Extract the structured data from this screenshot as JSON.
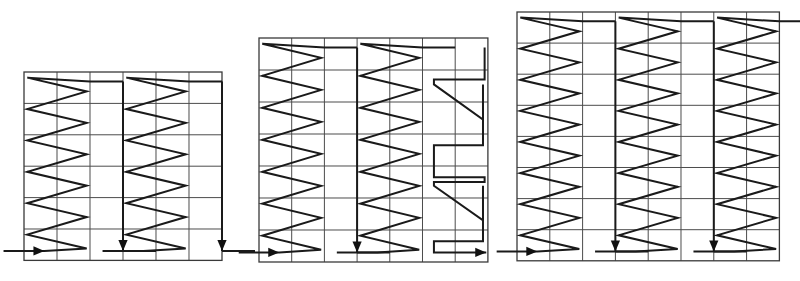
{
  "figure": {
    "title": "",
    "background_color": "#ffffff",
    "grid_line_color": "#4a4a4a",
    "path_color": "#1a1a1a",
    "panel_count": 3
  },
  "panels": [
    {
      "name": "panel-left",
      "label": "",
      "grid": {
        "cols": 6,
        "rows": 6
      },
      "origin": {
        "x": 24,
        "y": 72
      },
      "cell": {
        "w": 33.0,
        "h": 31.4
      },
      "bands": [
        {
          "name": "band-1",
          "type": "zigzag-up",
          "start_col": 0,
          "width_cols": 2,
          "teeth": 6,
          "entry": {
            "col": 0,
            "row": 6,
            "dir": "right"
          },
          "entry_arrow": true,
          "exit": {
            "col": 2,
            "row": 0,
            "dir": "right"
          }
        },
        {
          "name": "return-1",
          "type": "vertical-down",
          "col": 3,
          "from_row": 0,
          "to_row": 6,
          "arrow": true
        },
        {
          "name": "band-2",
          "type": "zigzag-up",
          "start_col": 3,
          "width_cols": 2,
          "teeth": 6,
          "entry": {
            "col": 3,
            "row": 6,
            "dir": "right"
          },
          "entry_arrow": false,
          "exit": {
            "col": 5,
            "row": 0,
            "dir": "right"
          }
        },
        {
          "name": "return-2",
          "type": "vertical-down",
          "col": 6,
          "from_row": 0,
          "to_row": 6,
          "arrow": true
        }
      ]
    },
    {
      "name": "panel-middle",
      "label": "",
      "grid": {
        "cols": 7,
        "rows": 7
      },
      "origin": {
        "x": 259,
        "y": 38
      },
      "cell": {
        "w": 32.7,
        "h": 32.0
      },
      "bands": [
        {
          "name": "band-1",
          "type": "zigzag-up",
          "start_col": 0,
          "width_cols": 2,
          "teeth": 7,
          "entry": {
            "col": 0,
            "row": 7,
            "dir": "right"
          },
          "entry_arrow": true,
          "exit": {
            "col": 2,
            "row": 0,
            "dir": "right"
          }
        },
        {
          "name": "return-1",
          "type": "vertical-down",
          "col": 3,
          "from_row": 0,
          "to_row": 7,
          "arrow": true
        },
        {
          "name": "band-2",
          "type": "zigzag-up",
          "start_col": 3,
          "width_cols": 2,
          "teeth": 7,
          "entry": {
            "col": 3,
            "row": 7,
            "dir": "right"
          },
          "entry_arrow": false,
          "exit": {
            "col": 5,
            "row": 0,
            "dir": "right"
          }
        },
        {
          "name": "band-3",
          "type": "z-step-down",
          "start_col": 5,
          "width_cols": 2,
          "steps": 3,
          "entry": {
            "col": 6,
            "row": 0,
            "dir": "down"
          },
          "exit": {
            "col": 6,
            "row": 7,
            "dir": "right"
          },
          "exit_arrow": true
        }
      ]
    },
    {
      "name": "panel-right",
      "label": "",
      "grid": {
        "cols": 8,
        "rows": 8
      },
      "origin": {
        "x": 517,
        "y": 12
      },
      "cell": {
        "w": 32.8,
        "h": 31.1
      },
      "bands": [
        {
          "name": "band-1",
          "type": "zigzag-up",
          "start_col": 0,
          "width_cols": 2,
          "teeth": 8,
          "entry": {
            "col": 0,
            "row": 8,
            "dir": "right"
          },
          "entry_arrow": true,
          "exit": {
            "col": 2,
            "row": 0,
            "dir": "right"
          }
        },
        {
          "name": "return-1",
          "type": "vertical-down",
          "col": 3,
          "from_row": 0,
          "to_row": 8,
          "arrow": true
        },
        {
          "name": "band-2",
          "type": "zigzag-up",
          "start_col": 3,
          "width_cols": 2,
          "teeth": 8,
          "entry": {
            "col": 3,
            "row": 8,
            "dir": "right"
          },
          "entry_arrow": false,
          "exit": {
            "col": 5,
            "row": 0,
            "dir": "right"
          }
        },
        {
          "name": "return-2",
          "type": "vertical-down",
          "col": 6,
          "from_row": 0,
          "to_row": 8,
          "arrow": true
        },
        {
          "name": "band-3",
          "type": "zigzag-up",
          "start_col": 6,
          "width_cols": 2,
          "teeth": 8,
          "entry": {
            "col": 6,
            "row": 8,
            "dir": "right"
          },
          "entry_arrow": false,
          "exit": {
            "col": 8,
            "row": 0,
            "dir": "right"
          },
          "exit_arrow": true
        }
      ]
    }
  ]
}
